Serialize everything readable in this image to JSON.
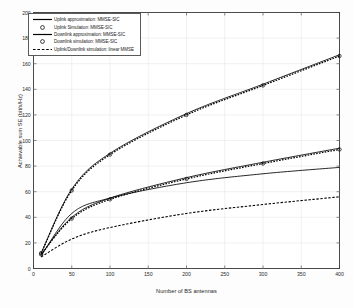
{
  "chart_data": {
    "type": "line",
    "title": "",
    "xlabel": "Number of BS antennas",
    "ylabel": "Achievable sum SE (bit/s/Hz)",
    "xlim": [
      0,
      400
    ],
    "ylim": [
      0,
      200
    ],
    "xticks": [
      0,
      50,
      100,
      150,
      200,
      250,
      300,
      350,
      400
    ],
    "xtick_labels": [
      "0",
      "50",
      "100",
      "150",
      "200",
      "250",
      "300",
      "350",
      "400"
    ],
    "yticks": [
      0,
      20,
      40,
      60,
      80,
      100,
      120,
      140,
      160,
      180,
      200
    ],
    "ytick_labels": [
      "0",
      "20",
      "40",
      "60",
      "80",
      "100",
      "120",
      "140",
      "160",
      "180",
      "200"
    ],
    "grid": true,
    "legend_position": "upper left",
    "x": [
      10,
      50,
      100,
      200,
      300,
      400
    ],
    "series": [
      {
        "name": "Uplink approximation: MMSE-SIC",
        "style": "solid",
        "marker": "none",
        "color": "#000000",
        "values": [
          12,
          62,
          90,
          121,
          144,
          167
        ]
      },
      {
        "name": "Uplink simulation: MMSE-SIC",
        "style": "dotted",
        "marker": "circle",
        "color": "#000000",
        "values": [
          12,
          61,
          89,
          120,
          143,
          166
        ]
      },
      {
        "name": "Downlink approximation: MMSE-SIC",
        "style": "solid",
        "marker": "none",
        "color": "#000000",
        "values": [
          11,
          40,
          55,
          71,
          83,
          94
        ]
      },
      {
        "name": "Downlink simulation: MMSE-SIC",
        "style": "dotted",
        "marker": "circle",
        "color": "#000000",
        "values": [
          11,
          39,
          54,
          70,
          82,
          93
        ]
      },
      {
        "name": "Uplink/Downlink simulation: linear MMSE (upper)",
        "style": "solid",
        "marker": "none",
        "color": "#000000",
        "values": [
          10,
          43,
          55,
          67,
          74,
          79
        ]
      },
      {
        "name": "Uplink/Downlink simulation: linear MMSE (lower)",
        "style": "dashed",
        "marker": "none",
        "color": "#000000",
        "values": [
          9,
          23,
          32,
          43,
          50,
          56
        ]
      }
    ],
    "legend_entries": [
      {
        "label": "Uplink approximation: MMSE-SIC",
        "type": "line-solid"
      },
      {
        "label": "Uplink Simulation: MMSE-SIC",
        "type": "marker-circle"
      },
      {
        "label": "Downlink approximation: MMSE-SIC",
        "type": "line-solid"
      },
      {
        "label": "Downlink simulation: MMSE-SIC",
        "type": "marker-circle"
      },
      {
        "label": "Uplink/Downlink simulation: linear MMSE",
        "type": "line-dashed"
      }
    ]
  }
}
